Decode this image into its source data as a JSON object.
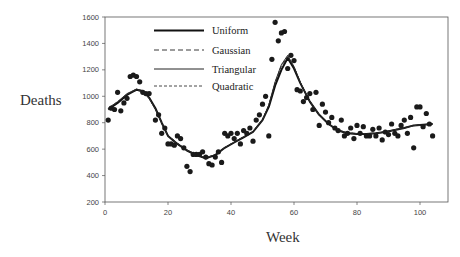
{
  "chart_data": {
    "type": "scatter",
    "title": "",
    "xlabel": "Week",
    "ylabel": "Deaths",
    "xlim": [
      0,
      109
    ],
    "ylim": [
      200,
      1600
    ],
    "xticks": [
      0,
      20,
      40,
      60,
      80,
      100
    ],
    "yticks": [
      200,
      400,
      600,
      800,
      1000,
      1200,
      1400,
      1600
    ],
    "grid": false,
    "legend_position": "upper-left-inside",
    "legend": [
      "Uniform",
      "Gaussian",
      "Triangular",
      "Quadratic"
    ],
    "series": [
      {
        "name": "Observed",
        "kind": "points",
        "x": [
          1,
          2,
          3,
          4,
          5,
          6,
          7,
          8,
          9,
          10,
          11,
          12,
          13,
          14,
          16,
          17,
          18,
          19,
          20,
          21,
          22,
          23,
          24,
          25,
          26,
          27,
          28,
          29,
          30,
          31,
          32,
          33,
          34,
          35,
          36,
          37,
          38,
          39,
          40,
          41,
          42,
          43,
          44,
          45,
          46,
          47,
          48,
          49,
          50,
          51,
          52,
          53,
          54,
          55,
          56,
          57,
          58,
          59,
          60,
          61,
          62,
          63,
          64,
          65,
          66,
          67,
          68,
          69,
          70,
          71,
          72,
          73,
          74,
          75,
          76,
          77,
          78,
          79,
          80,
          81,
          82,
          83,
          84,
          85,
          86,
          87,
          88,
          89,
          90,
          91,
          92,
          93,
          94,
          95,
          96,
          97,
          98,
          99,
          100,
          101,
          102,
          103,
          104
        ],
        "y": [
          820,
          910,
          900,
          1030,
          890,
          950,
          985,
          1150,
          1160,
          1150,
          1110,
          1030,
          1020,
          1020,
          820,
          860,
          720,
          760,
          640,
          640,
          630,
          700,
          680,
          610,
          470,
          430,
          560,
          560,
          560,
          580,
          540,
          490,
          480,
          540,
          580,
          500,
          720,
          700,
          720,
          680,
          720,
          640,
          740,
          720,
          760,
          660,
          820,
          860,
          940,
          1000,
          700,
          1280,
          1560,
          1420,
          1480,
          1490,
          1210,
          1310,
          1270,
          1050,
          1040,
          960,
          990,
          1020,
          900,
          1030,
          780,
          940,
          880,
          800,
          840,
          760,
          740,
          820,
          700,
          720,
          760,
          680,
          780,
          720,
          770,
          700,
          700,
          750,
          700,
          760,
          670,
          730,
          710,
          790,
          720,
          700,
          780,
          820,
          720,
          840,
          610,
          920,
          920,
          770,
          870,
          790,
          700
        ],
        "color": "#1a1a1a"
      },
      {
        "name": "Uniform",
        "kind": "line",
        "style": "solid-thick",
        "x": [
          1,
          4,
          7,
          10,
          12,
          14,
          16,
          18,
          20,
          23,
          26,
          29,
          32,
          35,
          38,
          41,
          44,
          47,
          50,
          52,
          54,
          56,
          58,
          60,
          62,
          65,
          68,
          71,
          74,
          77,
          80,
          83,
          86,
          89,
          92,
          95,
          98,
          101,
          104
        ],
        "y": [
          900,
          950,
          1010,
          1050,
          1040,
          990,
          910,
          800,
          700,
          640,
          590,
          555,
          530,
          555,
          610,
          650,
          690,
          730,
          820,
          920,
          1080,
          1200,
          1290,
          1210,
          1100,
          960,
          860,
          790,
          740,
          720,
          715,
          715,
          720,
          730,
          745,
          760,
          780,
          785,
          790
        ]
      },
      {
        "name": "Gaussian",
        "kind": "line",
        "style": "dashed",
        "x": [
          1,
          4,
          7,
          10,
          12,
          14,
          16,
          18,
          20,
          23,
          26,
          29,
          32,
          35,
          38,
          41,
          44,
          47,
          50,
          52,
          54,
          56,
          58,
          60,
          62,
          65,
          68,
          71,
          74,
          77,
          80,
          83,
          86,
          89,
          92,
          95,
          98,
          101,
          104
        ],
        "y": [
          905,
          955,
          1015,
          1045,
          1035,
          985,
          905,
          800,
          705,
          645,
          595,
          560,
          535,
          560,
          610,
          655,
          695,
          735,
          825,
          930,
          1100,
          1230,
          1300,
          1220,
          1105,
          965,
          860,
          790,
          745,
          725,
          718,
          718,
          722,
          732,
          748,
          762,
          778,
          784,
          790
        ]
      },
      {
        "name": "Triangular",
        "kind": "line",
        "style": "solid-thin",
        "x": [
          1,
          4,
          7,
          10,
          12,
          14,
          16,
          18,
          20,
          23,
          26,
          29,
          32,
          35,
          38,
          41,
          44,
          47,
          50,
          52,
          54,
          56,
          58,
          60,
          62,
          65,
          68,
          71,
          74,
          77,
          80,
          83,
          86,
          89,
          92,
          95,
          98,
          101,
          104
        ],
        "y": [
          910,
          960,
          1020,
          1055,
          1040,
          985,
          900,
          795,
          700,
          640,
          590,
          558,
          532,
          558,
          612,
          652,
          692,
          732,
          822,
          935,
          1110,
          1240,
          1310,
          1225,
          1105,
          962,
          858,
          788,
          742,
          722,
          716,
          716,
          720,
          731,
          746,
          761,
          778,
          785,
          792
        ]
      },
      {
        "name": "Quadratic",
        "kind": "line",
        "style": "dotted",
        "x": [
          1,
          4,
          7,
          10,
          12,
          14,
          16,
          18,
          20,
          23,
          26,
          29,
          32,
          35,
          38,
          41,
          44,
          47,
          50,
          52,
          54,
          56,
          58,
          60,
          62,
          65,
          68,
          71,
          74,
          77,
          80,
          83,
          86,
          89,
          92,
          95,
          98,
          101,
          104
        ],
        "y": [
          908,
          958,
          1018,
          1052,
          1038,
          986,
          902,
          798,
          702,
          642,
          592,
          558,
          533,
          558,
          611,
          653,
          693,
          733,
          823,
          932,
          1105,
          1235,
          1305,
          1222,
          1104,
          963,
          859,
          789,
          743,
          723,
          717,
          717,
          721,
          731,
          747,
          761,
          778,
          785,
          791
        ]
      }
    ]
  },
  "labels": {
    "y_axis": "Deaths",
    "x_axis": "Week"
  },
  "legend_items": [
    {
      "label": "Uniform"
    },
    {
      "label": "Gaussian"
    },
    {
      "label": "Triangular"
    },
    {
      "label": "Quadratic"
    }
  ]
}
